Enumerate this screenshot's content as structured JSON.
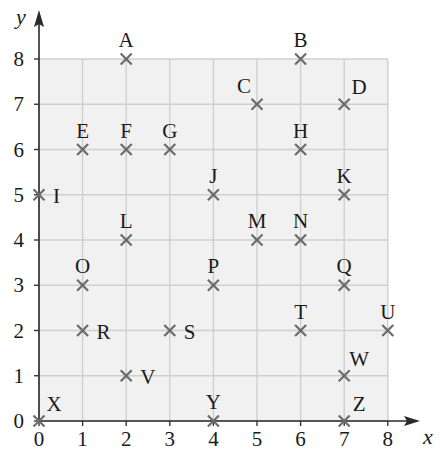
{
  "chart_data": {
    "type": "scatter",
    "title": "",
    "xlabel": "x",
    "ylabel": "y",
    "xlim": [
      0,
      8
    ],
    "ylim": [
      0,
      8
    ],
    "grid": true,
    "x_ticks": [
      "0",
      "1",
      "2",
      "3",
      "4",
      "5",
      "6",
      "7",
      "8"
    ],
    "y_ticks": [
      "0",
      "1",
      "2",
      "3",
      "4",
      "5",
      "6",
      "7",
      "8"
    ],
    "marker": "cross",
    "points": [
      {
        "label": "A",
        "x": 2,
        "y": 8,
        "pos": "above"
      },
      {
        "label": "B",
        "x": 6,
        "y": 8,
        "pos": "above"
      },
      {
        "label": "C",
        "x": 5,
        "y": 7,
        "pos": "above-left"
      },
      {
        "label": "D",
        "x": 7,
        "y": 7,
        "pos": "above-right"
      },
      {
        "label": "E",
        "x": 1,
        "y": 6,
        "pos": "above"
      },
      {
        "label": "F",
        "x": 2,
        "y": 6,
        "pos": "above"
      },
      {
        "label": "G",
        "x": 3,
        "y": 6,
        "pos": "above"
      },
      {
        "label": "H",
        "x": 6,
        "y": 6,
        "pos": "above"
      },
      {
        "label": "I",
        "x": 0,
        "y": 5,
        "pos": "right"
      },
      {
        "label": "J",
        "x": 4,
        "y": 5,
        "pos": "above"
      },
      {
        "label": "K",
        "x": 7,
        "y": 5,
        "pos": "above"
      },
      {
        "label": "L",
        "x": 2,
        "y": 4,
        "pos": "above"
      },
      {
        "label": "M",
        "x": 5,
        "y": 4,
        "pos": "above"
      },
      {
        "label": "N",
        "x": 6,
        "y": 4,
        "pos": "above"
      },
      {
        "label": "O",
        "x": 1,
        "y": 3,
        "pos": "above"
      },
      {
        "label": "P",
        "x": 4,
        "y": 3,
        "pos": "above"
      },
      {
        "label": "Q",
        "x": 7,
        "y": 3,
        "pos": "above"
      },
      {
        "label": "R",
        "x": 1,
        "y": 2,
        "pos": "right"
      },
      {
        "label": "S",
        "x": 3,
        "y": 2,
        "pos": "right"
      },
      {
        "label": "T",
        "x": 6,
        "y": 2,
        "pos": "above"
      },
      {
        "label": "U",
        "x": 8,
        "y": 2,
        "pos": "above"
      },
      {
        "label": "V",
        "x": 2,
        "y": 1,
        "pos": "right"
      },
      {
        "label": "W",
        "x": 7,
        "y": 1,
        "pos": "above-right"
      },
      {
        "label": "X",
        "x": 0,
        "y": 0,
        "pos": "above-right"
      },
      {
        "label": "Y",
        "x": 4,
        "y": 0,
        "pos": "above"
      },
      {
        "label": "Z",
        "x": 7,
        "y": 0,
        "pos": "above-right"
      }
    ]
  },
  "colors": {
    "grid_fill": "#f1f1f1",
    "grid_line": "#cfcfcf",
    "axis": "#2a2a2a",
    "marker": "#6b6b6b",
    "text": "#1a1a1a"
  }
}
